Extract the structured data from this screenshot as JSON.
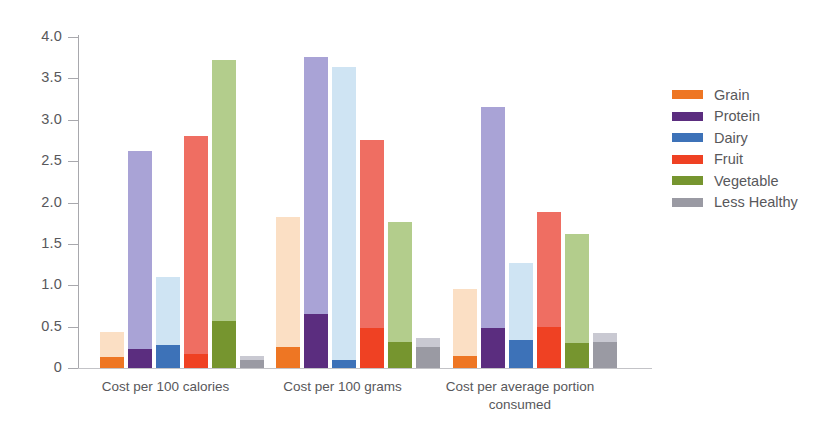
{
  "chart_data": {
    "type": "bar",
    "title": "",
    "subtitle": "",
    "xlabel": "",
    "ylabel": "",
    "ylim": [
      0,
      4.0
    ],
    "ytick_labels": [
      "4.0",
      "3.5",
      "3.0",
      "2.5",
      "2.0",
      "1.5",
      "1.0",
      "0.5",
      "0"
    ],
    "ytick_values": [
      4.0,
      3.5,
      3.0,
      2.5,
      2.0,
      1.5,
      1.0,
      0.5,
      0
    ],
    "grid": false,
    "legend_position": "right",
    "categories": [
      "Cost per 100 calories",
      "Cost per 100 grams",
      "Cost per average portion consumed"
    ],
    "note": "Each bar is drawn in two tones: a saturated lower segment and a lighter upper segment; the bar total is the lighter segment's top.",
    "series": [
      {
        "name": "Grain",
        "color": "#ee7623",
        "light_color": "#fbdfc4",
        "values": [
          0.44,
          1.83,
          0.95
        ],
        "base_values": [
          0.13,
          0.25,
          0.15
        ]
      },
      {
        "name": "Protein",
        "color": "#5b2d7f",
        "light_color": "#a9a3d6",
        "values": [
          2.62,
          3.76,
          3.16
        ],
        "base_values": [
          0.23,
          0.65,
          0.48
        ]
      },
      {
        "name": "Dairy",
        "color": "#3d72b8",
        "light_color": "#cfe4f3",
        "values": [
          1.1,
          3.64,
          1.27
        ],
        "base_values": [
          0.28,
          0.1,
          0.34
        ]
      },
      {
        "name": "Fruit",
        "color": "#ef4123",
        "light_color": "#ef6e62",
        "values": [
          2.8,
          2.76,
          1.88
        ],
        "base_values": [
          0.17,
          0.48,
          0.5
        ]
      },
      {
        "name": "Vegetable",
        "color": "#76952f",
        "light_color": "#b3cd8c",
        "values": [
          3.72,
          1.77,
          1.62
        ],
        "base_values": [
          0.57,
          0.32,
          0.3
        ]
      },
      {
        "name": "Less Healthy",
        "color": "#9a9aa3",
        "light_color": "#c9c9d2",
        "values": [
          0.14,
          0.36,
          0.42
        ],
        "base_values": [
          0.1,
          0.26,
          0.32
        ]
      }
    ]
  },
  "legend": {
    "items": [
      {
        "label": "Grain",
        "color": "#ee7623"
      },
      {
        "label": "Protein",
        "color": "#5b2d7f"
      },
      {
        "label": "Dairy",
        "color": "#3d72b8"
      },
      {
        "label": "Fruit",
        "color": "#ef4123"
      },
      {
        "label": "Vegetable",
        "color": "#76952f"
      },
      {
        "label": "Less Healthy",
        "color": "#9a9aa3"
      }
    ]
  }
}
